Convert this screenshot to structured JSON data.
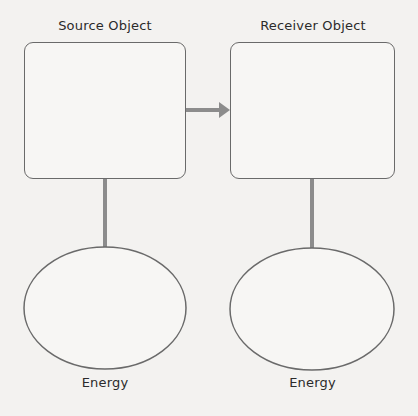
{
  "diagram": {
    "source": {
      "title": "Source Object"
    },
    "receiver": {
      "title": "Receiver Object"
    },
    "source_energy": {
      "label": "Energy"
    },
    "receiver_energy": {
      "label": "Energy"
    },
    "colors": {
      "background": "#f3f2f0",
      "outline": "#6a6a6a",
      "connector": "#8c8c8c",
      "text": "#2b2b2b"
    }
  }
}
